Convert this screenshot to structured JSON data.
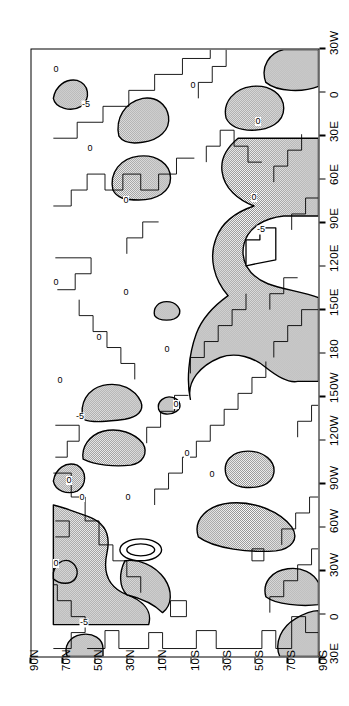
{
  "figure": {
    "kind": "global-contour-map",
    "orientation": "rotated-90-ccw",
    "frame_color": "#000000",
    "background_color": "#ffffff",
    "shade_color": "#b8b8b8"
  },
  "axes": {
    "longitude_axis": {
      "name": "longitude",
      "labels": [
        "30E",
        "0",
        "30W",
        "60W",
        "90W",
        "120W",
        "150W",
        "180",
        "150E",
        "120E",
        "90E",
        "60E",
        "30E",
        "0",
        "30W"
      ],
      "values": [
        30,
        0,
        -30,
        -60,
        -90,
        -120,
        -150,
        180,
        150,
        120,
        90,
        60,
        30,
        0,
        -30
      ],
      "tick_count": 15,
      "step_degrees": 30
    },
    "latitude_axis": {
      "name": "latitude",
      "labels": [
        "90N",
        "70N",
        "50N",
        "30N",
        "10N",
        "10S",
        "30S",
        "50S",
        "70S",
        "90S"
      ],
      "values": [
        90,
        70,
        50,
        30,
        10,
        -10,
        -30,
        -50,
        -70,
        -90
      ],
      "tick_count": 10,
      "step_degrees": 20
    }
  },
  "contours": {
    "levels": [
      -5,
      0,
      5
    ],
    "zero_label": "0",
    "negative_label": "-5",
    "positive_label": "5",
    "shaded_level": "0",
    "labels": [
      {
        "text": "-5",
        "x": 0.055,
        "y": 0.185
      },
      {
        "text": "0",
        "x": 0.155,
        "y": 0.085
      },
      {
        "text": "0",
        "x": 0.262,
        "y": 0.175
      },
      {
        "text": "0",
        "x": 0.29,
        "y": 0.13
      },
      {
        "text": "-5",
        "x": 0.392,
        "y": 0.17
      },
      {
        "text": "0",
        "x": 0.455,
        "y": 0.1
      },
      {
        "text": "0",
        "x": 0.415,
        "y": 0.5
      },
      {
        "text": "0",
        "x": 0.335,
        "y": 0.54
      },
      {
        "text": "0",
        "x": 0.262,
        "y": 0.335
      },
      {
        "text": "0",
        "x": 0.3,
        "y": 0.625
      },
      {
        "text": "0",
        "x": 0.525,
        "y": 0.235
      },
      {
        "text": "0",
        "x": 0.505,
        "y": 0.47
      },
      {
        "text": "0",
        "x": 0.6,
        "y": 0.33
      },
      {
        "text": "0",
        "x": 0.615,
        "y": 0.085
      },
      {
        "text": "-5",
        "x": 0.7,
        "y": 0.795
      },
      {
        "text": "0",
        "x": 0.75,
        "y": 0.33
      },
      {
        "text": "0",
        "x": 0.755,
        "y": 0.77
      },
      {
        "text": "0",
        "x": 0.835,
        "y": 0.205
      },
      {
        "text": "0",
        "x": 0.88,
        "y": 0.785
      },
      {
        "text": "-5",
        "x": 0.905,
        "y": 0.19
      },
      {
        "text": "0",
        "x": 0.94,
        "y": 0.56
      },
      {
        "text": "0",
        "x": 0.965,
        "y": 0.085
      }
    ]
  },
  "chart_data": {
    "type": "heatmap",
    "title": "",
    "subtitle": "",
    "xlabel": "",
    "ylabel": "",
    "projection": "cylindrical-equidistant",
    "xlim": [
      30,
      -30
    ],
    "ylim": [
      90,
      -90
    ],
    "grid": false,
    "legend": "none",
    "contour_interval": 5,
    "contour_levels": [
      -5,
      0,
      5
    ],
    "shading": "stipple fill where field exceeds the 0 contour",
    "x": [
      30,
      0,
      -30,
      -60,
      -90,
      -120,
      -150,
      180,
      150,
      120,
      90,
      60,
      30,
      0,
      -30
    ],
    "xtick_labels": [
      "30E",
      "0",
      "30W",
      "60W",
      "90W",
      "120W",
      "150W",
      "180",
      "150E",
      "120E",
      "90E",
      "60E",
      "30E",
      "0",
      "30W"
    ],
    "y": [
      90,
      70,
      50,
      30,
      10,
      -10,
      -30,
      -50,
      -70,
      -90
    ],
    "ytick_labels": [
      "90N",
      "70N",
      "50N",
      "30N",
      "10N",
      "10S",
      "30S",
      "50S",
      "70S",
      "90S"
    ],
    "annotations": [
      "-5",
      "0",
      "5"
    ]
  }
}
